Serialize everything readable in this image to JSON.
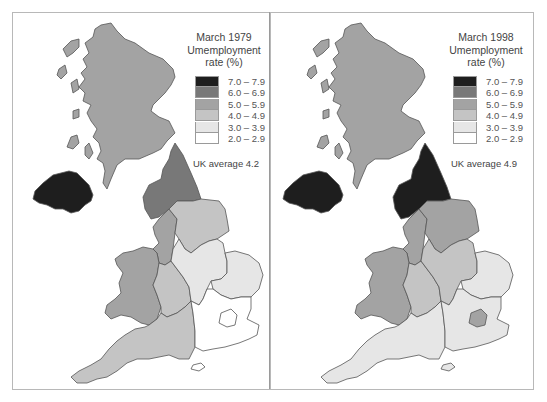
{
  "colors": {
    "c7": "#1e1e1e",
    "c6": "#787878",
    "c5": "#a3a3a3",
    "c4": "#c4c4c4",
    "c3": "#e6e6e6",
    "c2": "#ffffff",
    "border": "#555555"
  },
  "legend_classes": [
    {
      "range": "7.0 – 7.9",
      "color": "#1e1e1e"
    },
    {
      "range": "6.0 – 6.9",
      "color": "#787878"
    },
    {
      "range": "5.0 – 5.9",
      "color": "#a3a3a3"
    },
    {
      "range": "4.0 – 4.9",
      "color": "#c4c4c4"
    },
    {
      "range": "3.0 – 3.9",
      "color": "#e6e6e6"
    },
    {
      "range": "2.0 – 2.9",
      "color": "#ffffff"
    }
  ],
  "maps": [
    {
      "title_line1": "March 1979",
      "title_line2": "Umemployment",
      "title_line3": "rate (%)",
      "average": "UK average 4.2",
      "regions": {
        "scotland": "5.0 – 5.9",
        "northern_ireland": "7.0 – 7.9",
        "north": "6.0 – 6.9",
        "north_west": "5.0 – 5.9",
        "yorkshire_humberside": "4.0 – 4.9",
        "wales": "5.0 – 5.9",
        "west_midlands": "4.0 – 4.9",
        "east_midlands": "3.0 – 3.9",
        "east_anglia": "3.0 – 3.9",
        "south_west": "4.0 – 4.9",
        "south_east": "2.0 – 2.9",
        "greater_london": "2.0 – 2.9"
      }
    },
    {
      "title_line1": "March 1998",
      "title_line2": "Umemployment",
      "title_line3": "rate (%)",
      "average": "UK average 4.9",
      "regions": {
        "scotland": "5.0 – 5.9",
        "northern_ireland": "7.0 – 7.9",
        "north": "7.0 – 7.9",
        "north_west": "5.0 – 5.9",
        "yorkshire_humberside": "5.0 – 5.9",
        "wales": "5.0 – 5.9",
        "west_midlands": "4.0 – 4.9",
        "east_midlands": "4.0 – 4.9",
        "east_anglia": "3.0 – 3.9",
        "south_west": "3.0 – 3.9",
        "south_east": "3.0 – 3.9",
        "greater_london": "5.0 – 5.9"
      }
    }
  ]
}
